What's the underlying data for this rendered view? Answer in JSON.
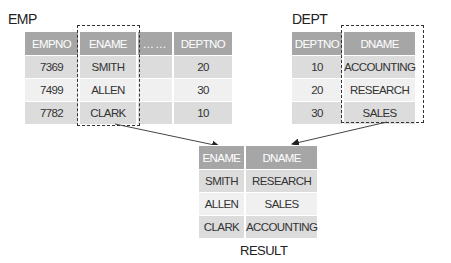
{
  "emp": {
    "label": "EMP",
    "columns": [
      "EMPNO",
      "ENAME",
      "……",
      "DEPTNO"
    ],
    "rows": [
      [
        "7369",
        "SMITH",
        "",
        "20"
      ],
      [
        "7499",
        "ALLEN",
        "",
        "30"
      ],
      [
        "7782",
        "CLARK",
        "",
        "10"
      ]
    ]
  },
  "dept": {
    "label": "DEPT",
    "columns": [
      "DEPTNO",
      "DNAME"
    ],
    "rows": [
      [
        "10",
        "ACCOUNTING"
      ],
      [
        "20",
        "RESEARCH"
      ],
      [
        "30",
        "SALES"
      ]
    ]
  },
  "result": {
    "label": "RESULT",
    "columns": [
      "ENAME",
      "DNAME"
    ],
    "rows": [
      [
        "SMITH",
        "RESEARCH"
      ],
      [
        "ALLEN",
        "SALES"
      ],
      [
        "CLARK",
        "ACCOUNTING"
      ]
    ]
  },
  "colors": {
    "header_bg": "#a6a6a6",
    "row_dark": "#dcdcdc",
    "row_light": "#f0f0f0",
    "dashed_border": "#333333"
  }
}
